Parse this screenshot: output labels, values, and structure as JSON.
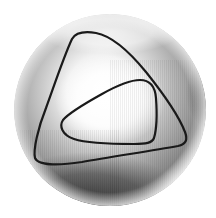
{
  "figure": {
    "colors": {
      "background": "#ffffff",
      "highlight": "#ffffff",
      "shadow": "#3a3a3a",
      "curve": "#1a1a1a"
    },
    "sphere": {
      "cx": 110,
      "cy": 110,
      "r": 96
    },
    "curves": [
      {
        "name": "outer-curve",
        "label": ""
      },
      {
        "name": "inner-curve",
        "label": ""
      }
    ]
  }
}
